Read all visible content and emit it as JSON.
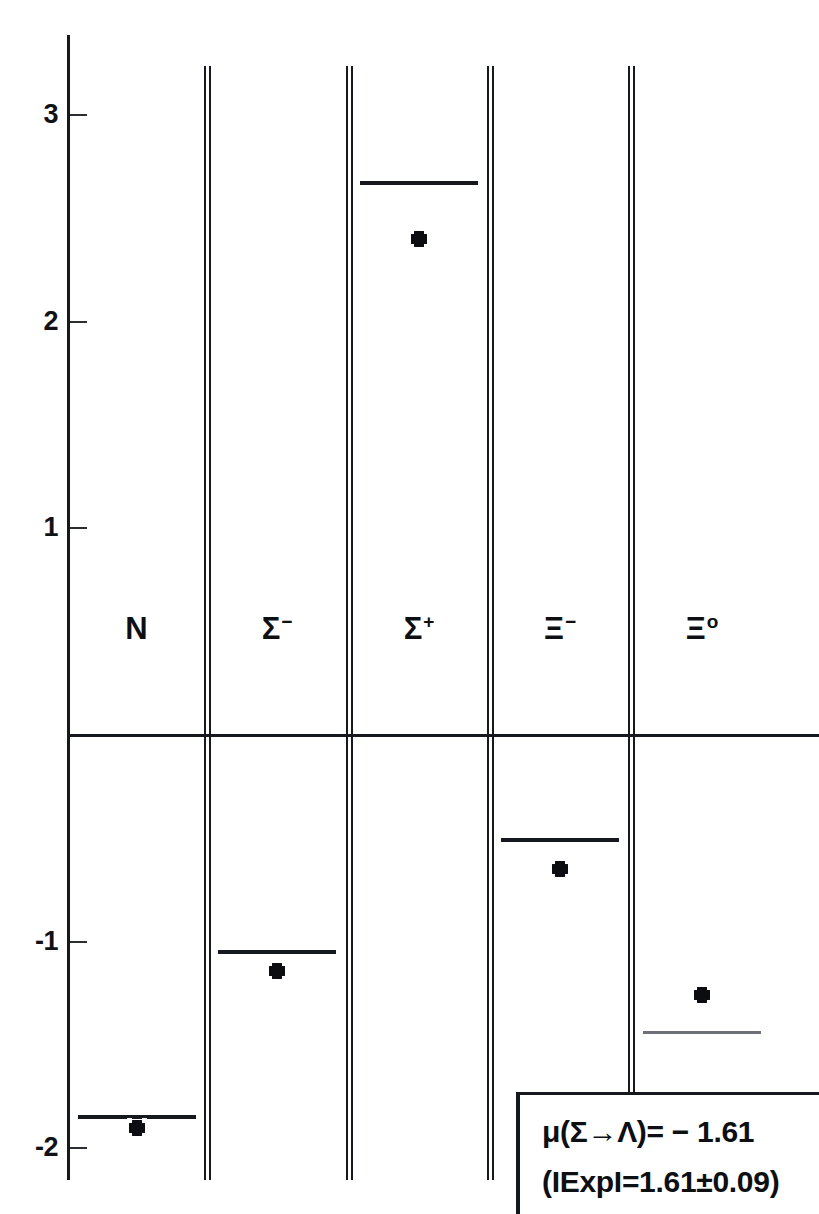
{
  "page": {
    "header_text": "",
    "background_color": "#ffffff",
    "ink_color": "#15181c"
  },
  "chart_data": {
    "type": "bar",
    "title": "",
    "subtitle": "",
    "xlabel": "",
    "ylabel": "",
    "grid": false,
    "legend_position": "bottom-right",
    "ylim": [
      -2.15,
      3.25
    ],
    "yticks": [
      3,
      2,
      1,
      -1,
      -2
    ],
    "ytick_labels": [
      "3",
      "2",
      "1",
      "-1",
      "-2"
    ],
    "zero_line": 0,
    "categories": [
      "N",
      "Σ⁻",
      "Σ⁺",
      "Ξ⁻",
      "Ξ⁰"
    ],
    "category_base": [
      "N",
      "Σ",
      "Σ",
      "Ξ",
      "Ξ"
    ],
    "category_superscript": [
      "",
      "−",
      "+",
      "−",
      "o"
    ],
    "series": [
      {
        "name": "Theory",
        "marker": "horizontal-bar",
        "values": [
          -1.85,
          -1.05,
          2.67,
          -0.51,
          -1.44
        ]
      },
      {
        "name": "Experiment",
        "marker": "filled-square",
        "values": [
          -1.9,
          -1.14,
          2.4,
          -0.65,
          -1.26
        ]
      }
    ],
    "annotations": [
      {
        "name": "mu-sigma-lambda",
        "text": "μ(Σ→Λ) = − 1.61"
      },
      {
        "name": "experimental-value",
        "text": "(IExpI = 1.61±0.09)"
      }
    ]
  },
  "axis": {
    "ticks": [
      {
        "label": "3",
        "value": 3
      },
      {
        "label": "2",
        "value": 2
      },
      {
        "label": "1",
        "value": 1
      },
      {
        "label": "-1",
        "value": -1
      },
      {
        "label": "-2",
        "value": -2
      }
    ]
  },
  "columns": [
    {
      "name": "N",
      "base": "N",
      "sup": ""
    },
    {
      "name": "Sigma-",
      "base": "Σ",
      "sup": "−"
    },
    {
      "name": "Sigma+",
      "base": "Σ",
      "sup": "+"
    },
    {
      "name": "Xi-",
      "base": "Ξ",
      "sup": "−"
    },
    {
      "name": "Xi0",
      "base": "Ξ",
      "sup": "o"
    }
  ],
  "legend": {
    "line_1": "μ(Σ→Λ)= − 1.61",
    "line_2": "(IExpI=1.61±0.09)"
  }
}
